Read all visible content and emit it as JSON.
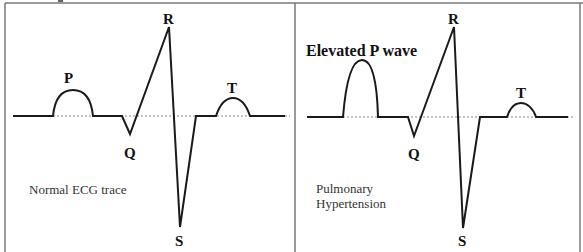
{
  "figure": {
    "panels": [
      {
        "id": "normal",
        "caption_lines": [
          "Normal ECG trace"
        ],
        "wave_labels": {
          "P": "P",
          "Q": "Q",
          "R": "R",
          "S": "S",
          "T": "T"
        },
        "annotation": ""
      },
      {
        "id": "pulmonary",
        "caption_lines": [
          "Pulmonary",
          "Hypertension"
        ],
        "wave_labels": {
          "Q": "Q",
          "R": "R",
          "S": "S",
          "T": "T"
        },
        "annotation": "Elevated P wave"
      }
    ],
    "colors": {
      "trace": "#1a1a1a",
      "border": "#777777",
      "baseline_dotted": "#8a8a8a"
    }
  }
}
